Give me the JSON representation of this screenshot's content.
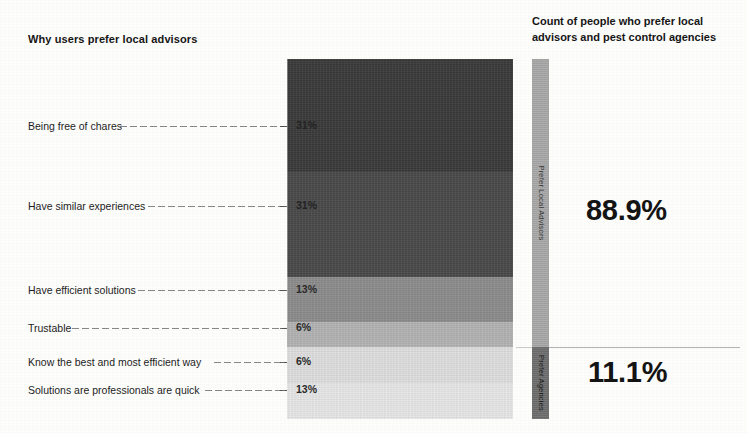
{
  "titles": {
    "left": "Why users prefer local advisors",
    "right_line1": "Count of people who prefer local",
    "right_line2": "advisors and pest control agencies"
  },
  "callouts": {
    "top": "88.9%",
    "bottom": "11.1%"
  },
  "chart_data": {
    "type": "bar",
    "subtype": "stacked-bar-100",
    "title": "Why users prefer local advisors",
    "xlabel": "",
    "ylabel": "",
    "orientation": "vertical-stack",
    "grid": false,
    "legend": "none",
    "categories": [
      "Being free of chares",
      "Have similar experiences",
      "Have efficient solutions",
      "Trustable",
      "Know the best and most efficient way",
      "Solutions are professionals are quick"
    ],
    "values": [
      31,
      31,
      13,
      6,
      6,
      13
    ],
    "value_labels": [
      "31%",
      "31%",
      "13%",
      "6%",
      "6%",
      "13%"
    ],
    "colors": [
      "#3b3b3b",
      "#4a4a4a",
      "#8d8d8d",
      "#b4b4b4",
      "#e0e0e0",
      "#e8e8e8"
    ],
    "secondary": {
      "type": "bar",
      "subtype": "stacked-bar-100",
      "title": "Count of people who prefer local advisors and pest control agencies",
      "categories": [
        "Prefer Local Advisors",
        "Prefer Agencies"
      ],
      "values": [
        88.9,
        11.1
      ],
      "value_labels": [
        "88.9%",
        "11.1%"
      ],
      "colors": [
        "#a8a8a8",
        "#6e6e6e"
      ]
    }
  },
  "segments": [
    {
      "label": "Being free of chares",
      "value": "31%",
      "color": "#3b3b3b",
      "top": 0,
      "height": 113,
      "text_tone": "dark",
      "label_y": 126,
      "leader_from": 120,
      "leader_to": 287
    },
    {
      "label": "Have similar experiences",
      "value": "31%",
      "color": "#4a4a4a",
      "top": 113,
      "height": 105,
      "text_tone": "dark",
      "label_y": 206,
      "leader_from": 148,
      "leader_to": 287
    },
    {
      "label": "Have efficient solutions",
      "value": "13%",
      "color": "#8d8d8d",
      "top": 218,
      "height": 45,
      "text_tone": "light",
      "label_y": 290,
      "leader_from": 138,
      "leader_to": 287
    },
    {
      "label": "Trustable",
      "value": "6%",
      "color": "#b4b4b4",
      "top": 263,
      "height": 25,
      "text_tone": "light",
      "label_y": 328,
      "leader_from": 72,
      "leader_to": 287
    },
    {
      "label": "Know the best and most efficient way",
      "value": "6%",
      "color": "#e0e0e0",
      "top": 288,
      "height": 36,
      "text_tone": "light",
      "label_y": 362,
      "leader_from": 214,
      "leader_to": 287
    },
    {
      "label": "Solutions are professionals are quick",
      "value": "13%",
      "color": "#e8e8e8",
      "top": 324,
      "height": 36,
      "text_tone": "light",
      "label_y": 390,
      "leader_from": 205,
      "leader_to": 287
    }
  ],
  "thin_segments": [
    {
      "label": "Prefer Local Advisors",
      "value": "88.9%",
      "color": "#a8a8a8",
      "top": 0,
      "height": 288,
      "text_tone": "dark"
    },
    {
      "label": "Prefer Agencies",
      "value": "11.1%",
      "color": "#6e6e6e",
      "top": 288,
      "height": 72,
      "text_tone": "light"
    }
  ]
}
